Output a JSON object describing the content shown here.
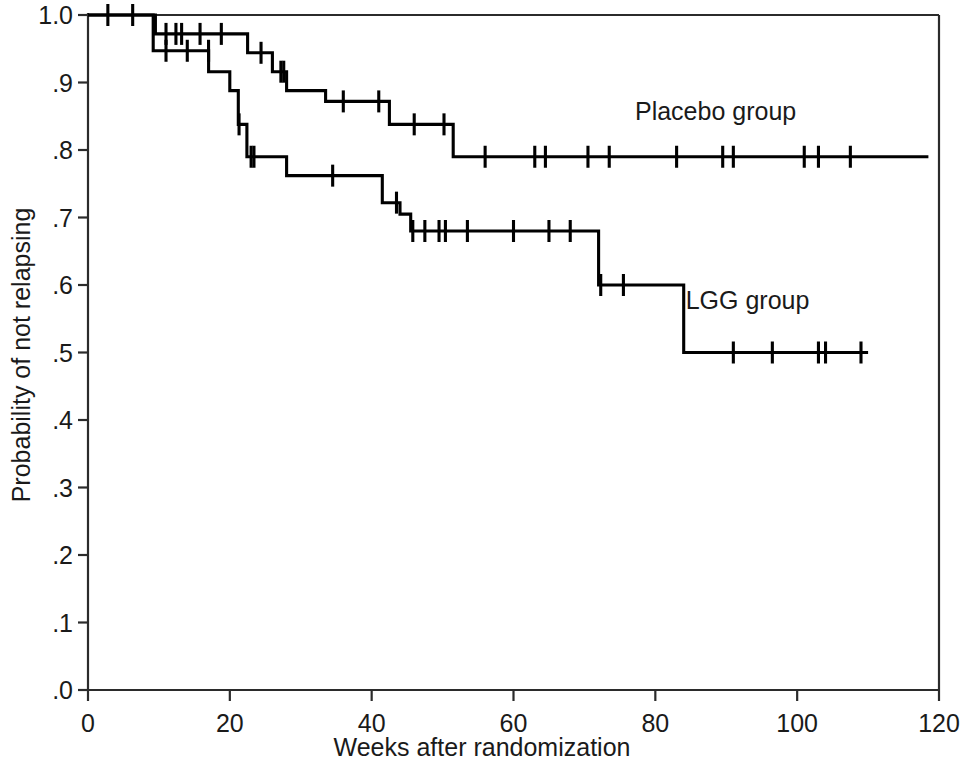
{
  "chart_data": {
    "type": "line",
    "subtype": "kaplan-meier-step",
    "title": "",
    "xlabel": "Weeks after randomization",
    "ylabel": "Probability of not relapsing",
    "xlim": [
      0,
      120
    ],
    "ylim": [
      0,
      1.0
    ],
    "xticks": [
      0,
      20,
      40,
      60,
      80,
      100,
      120
    ],
    "xtick_labels": [
      "0",
      "20",
      "40",
      "60",
      "80",
      "100",
      "120"
    ],
    "yticks": [
      0.0,
      0.1,
      0.2,
      0.3,
      0.4,
      0.5,
      0.6,
      0.7,
      0.8,
      0.9,
      1.0
    ],
    "ytick_labels": [
      ".0",
      ".1",
      ".2",
      ".3",
      ".4",
      ".5",
      ".6",
      ".7",
      ".8",
      ".9",
      "1.0"
    ],
    "grid": false,
    "legend_position": "inline-annotation",
    "frame": [
      "left",
      "bottom",
      "right",
      "top-partial"
    ],
    "series": [
      {
        "name": "Placebo group",
        "label": "Placebo group",
        "color": "#000000",
        "label_x": 88.5,
        "label_y": 0.845,
        "steps": [
          [
            0,
            1.0
          ],
          [
            9.5,
            1.0
          ],
          [
            9.5,
            0.972
          ],
          [
            22.5,
            0.972
          ],
          [
            22.5,
            0.944
          ],
          [
            26.0,
            0.944
          ],
          [
            26.0,
            0.916
          ],
          [
            28.0,
            0.916
          ],
          [
            28.0,
            0.888
          ],
          [
            33.5,
            0.888
          ],
          [
            33.5,
            0.872
          ],
          [
            42.5,
            0.872
          ],
          [
            42.5,
            0.838
          ],
          [
            51.5,
            0.838
          ],
          [
            51.5,
            0.79
          ],
          [
            118.5,
            0.79
          ]
        ],
        "censors": [
          [
            2.8,
            1.0
          ],
          [
            6.3,
            1.0
          ],
          [
            11.0,
            0.972
          ],
          [
            12.4,
            0.972
          ],
          [
            13.2,
            0.972
          ],
          [
            15.8,
            0.972
          ],
          [
            18.8,
            0.972
          ],
          [
            24.4,
            0.944
          ],
          [
            27.2,
            0.916
          ],
          [
            27.6,
            0.916
          ],
          [
            36.0,
            0.872
          ],
          [
            41.0,
            0.872
          ],
          [
            46.0,
            0.838
          ],
          [
            50.2,
            0.838
          ],
          [
            56.0,
            0.79
          ],
          [
            63.0,
            0.79
          ],
          [
            64.5,
            0.79
          ],
          [
            70.5,
            0.79
          ],
          [
            73.5,
            0.79
          ],
          [
            83.0,
            0.79
          ],
          [
            89.5,
            0.79
          ],
          [
            91.0,
            0.79
          ],
          [
            101.0,
            0.79
          ],
          [
            103.0,
            0.79
          ],
          [
            107.5,
            0.79
          ]
        ]
      },
      {
        "name": "LGG group",
        "label": "LGG group",
        "color": "#000000",
        "label_x": 93.0,
        "label_y": 0.565,
        "steps": [
          [
            0,
            1.0
          ],
          [
            9.2,
            1.0
          ],
          [
            9.2,
            0.947
          ],
          [
            17.0,
            0.947
          ],
          [
            17.0,
            0.916
          ],
          [
            20.0,
            0.916
          ],
          [
            20.0,
            0.888
          ],
          [
            21.2,
            0.888
          ],
          [
            21.2,
            0.838
          ],
          [
            22.4,
            0.838
          ],
          [
            22.4,
            0.79
          ],
          [
            28.0,
            0.79
          ],
          [
            28.0,
            0.762
          ],
          [
            41.5,
            0.762
          ],
          [
            41.5,
            0.722
          ],
          [
            44.0,
            0.722
          ],
          [
            44.0,
            0.705
          ],
          [
            45.5,
            0.705
          ],
          [
            45.5,
            0.68
          ],
          [
            72.0,
            0.68
          ],
          [
            72.0,
            0.6
          ],
          [
            84.0,
            0.6
          ],
          [
            84.0,
            0.5
          ],
          [
            110.0,
            0.5
          ]
        ],
        "censors": [
          [
            11.0,
            0.947
          ],
          [
            14.0,
            0.947
          ],
          [
            17.0,
            0.947
          ],
          [
            21.3,
            0.838
          ],
          [
            23.0,
            0.79
          ],
          [
            23.4,
            0.79
          ],
          [
            34.5,
            0.762
          ],
          [
            43.5,
            0.722
          ],
          [
            45.8,
            0.68
          ],
          [
            47.5,
            0.68
          ],
          [
            49.5,
            0.68
          ],
          [
            50.4,
            0.68
          ],
          [
            53.5,
            0.68
          ],
          [
            60.0,
            0.68
          ],
          [
            65.0,
            0.68
          ],
          [
            68.0,
            0.68
          ],
          [
            72.3,
            0.6
          ],
          [
            75.5,
            0.6
          ],
          [
            91.0,
            0.5
          ],
          [
            96.5,
            0.5
          ],
          [
            103.0,
            0.5
          ],
          [
            104.0,
            0.5
          ],
          [
            109.0,
            0.5
          ]
        ]
      }
    ]
  },
  "axes": {
    "x_title": "Weeks after randomization",
    "y_title": "Probability of not relapsing"
  }
}
